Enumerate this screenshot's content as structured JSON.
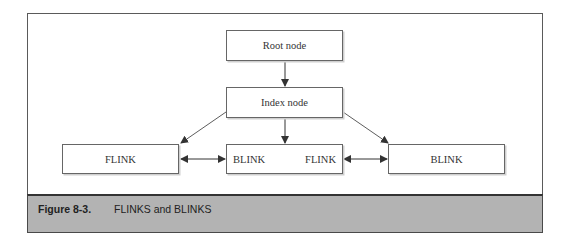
{
  "diagram": {
    "nodes": {
      "root": {
        "label": "Root node"
      },
      "index": {
        "label": "Index node"
      },
      "left": {
        "label": "FLINK"
      },
      "middle": {
        "left_label": "BLINK",
        "right_label": "FLINK"
      },
      "right": {
        "label": "BLINK"
      }
    },
    "edges": [
      {
        "from": "root",
        "to": "index",
        "type": "arrow"
      },
      {
        "from": "index",
        "to": "left",
        "type": "arrow"
      },
      {
        "from": "index",
        "to": "middle",
        "type": "arrow"
      },
      {
        "from": "index",
        "to": "right",
        "type": "arrow"
      },
      {
        "from": "left",
        "to": "middle",
        "type": "bidirectional"
      },
      {
        "from": "middle",
        "to": "right",
        "type": "bidirectional"
      }
    ]
  },
  "caption": {
    "number": "Figure 8-3.",
    "text": "FLINKS and BLINKS"
  }
}
